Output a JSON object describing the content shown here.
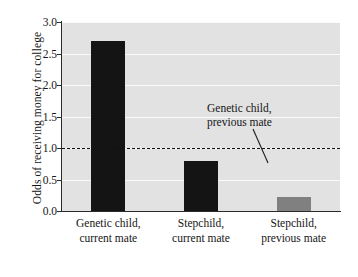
{
  "chart_data": {
    "type": "bar",
    "title": "",
    "xlabel": "",
    "ylabel": "Odds of receiving money for college",
    "categories": [
      "Genetic child, current mate",
      "Stepchild, current mate",
      "Stepchild, previous mate"
    ],
    "category_lines": [
      [
        "Genetic child,",
        "current mate"
      ],
      [
        "Stepchild,",
        "current mate"
      ],
      [
        "Stepchild,",
        "previous mate"
      ]
    ],
    "values": [
      2.7,
      0.8,
      0.22
    ],
    "bar_colors": [
      "#141414",
      "#141414",
      "#808080"
    ],
    "ylim": [
      0.0,
      3.0
    ],
    "yticks": [
      0.0,
      0.5,
      1.0,
      1.5,
      2.0,
      2.5,
      3.0
    ],
    "ytick_labels": [
      "0.0",
      "0.5",
      "1.0",
      "1.5",
      "2.0",
      "2.5",
      "3.0"
    ],
    "grid": true,
    "legend": "none",
    "reference_line": {
      "value": 1.0,
      "style": "dashed",
      "color": "#111111",
      "label": "Genetic child, previous mate",
      "label_lines": [
        "Genetic child,",
        "previous mate"
      ]
    },
    "plot_background": "#e2e2e2",
    "gridline_color": "#fbfbfb"
  }
}
